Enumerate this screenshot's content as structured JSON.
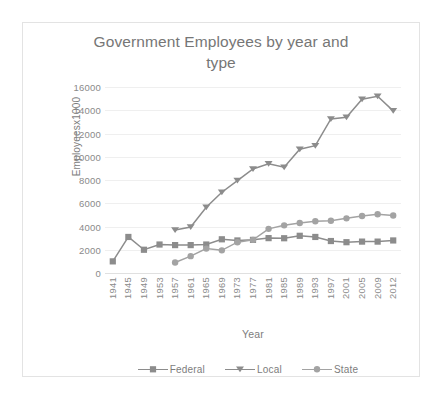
{
  "chart_data": {
    "type": "line",
    "title": "Government Employees by year and type",
    "title_line1": "Government Employees by year and",
    "title_line2": "type",
    "xlabel": "Year",
    "ylabel": "Employeesx1000",
    "ylim": [
      0,
      16000
    ],
    "ytick_step": 2000,
    "yticks": [
      "16000",
      "14000",
      "12000",
      "10000",
      "8000",
      "6000",
      "4000",
      "2000",
      "0"
    ],
    "grid": true,
    "legend_position": "bottom",
    "categories": [
      "1941",
      "1945",
      "1949",
      "1953",
      "1957",
      "1961",
      "1965",
      "1969",
      "1973",
      "1977",
      "1981",
      "1985",
      "1989",
      "1993",
      "1997",
      "2001",
      "2005",
      "2009",
      "2012"
    ],
    "series": [
      {
        "name": "Federal",
        "marker": "square",
        "color": "#8c8c8c",
        "values": [
          1000,
          3100,
          2000,
          2450,
          2400,
          2400,
          2450,
          2900,
          2800,
          2850,
          3000,
          2990,
          3200,
          3100,
          2750,
          2650,
          2700,
          2700,
          2800
        ]
      },
      {
        "name": "Local",
        "marker": "triangle",
        "color": "#8c8c8c",
        "values": [
          null,
          null,
          null,
          null,
          3700,
          3950,
          5650,
          6950,
          7950,
          8950,
          9400,
          9100,
          10650,
          10950,
          13250,
          13400,
          14950,
          15200,
          13950
        ]
      },
      {
        "name": "State",
        "marker": "circle",
        "color": "#a3a3a3",
        "values": [
          null,
          null,
          null,
          null,
          900,
          1450,
          2100,
          1950,
          2650,
          2850,
          3800,
          4100,
          4300,
          4450,
          4500,
          4700,
          4900,
          5050,
          4950
        ]
      }
    ]
  },
  "legend": {
    "items": [
      {
        "label": "Federal",
        "marker": "square"
      },
      {
        "label": "Local",
        "marker": "triangle"
      },
      {
        "label": "State",
        "marker": "circle"
      }
    ]
  },
  "colors": {
    "border": "#e3e3e3",
    "gridline": "#efefef",
    "text": "#7d7d7d",
    "tick_text": "#8a8a8a",
    "series_dark": "#8c8c8c",
    "series_light": "#a3a3a3"
  }
}
